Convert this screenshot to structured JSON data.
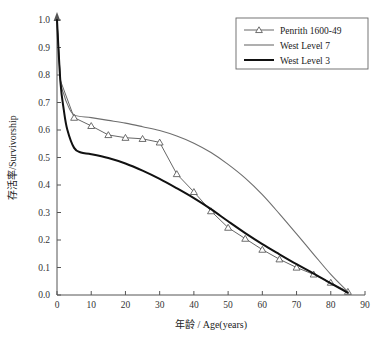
{
  "chart_data": {
    "type": "line",
    "title": "",
    "xlabel": "年龄 / Age(years)",
    "ylabel": "存活率/Survivorship",
    "xlim": [
      0,
      90
    ],
    "ylim": [
      0.0,
      1.0
    ],
    "xticks": [
      0,
      10,
      20,
      30,
      40,
      50,
      60,
      70,
      80,
      90
    ],
    "yticks": [
      0.0,
      0.1,
      0.2,
      0.3,
      0.4,
      0.5,
      0.6,
      0.7,
      0.8,
      0.9,
      1.0
    ],
    "grid": false,
    "legend_position": "top-right",
    "series": [
      {
        "name": "Penrith 1600-49",
        "color": "#555555",
        "marker": "triangle-open",
        "linewidth": 0.9,
        "x": [
          0,
          1,
          5,
          10,
          15,
          20,
          25,
          30,
          35,
          40,
          45,
          50,
          55,
          60,
          65,
          70,
          75,
          80,
          85
        ],
        "y": [
          1.0,
          0.78,
          0.645,
          0.615,
          0.582,
          0.572,
          0.568,
          0.555,
          0.44,
          0.375,
          0.305,
          0.245,
          0.205,
          0.165,
          0.13,
          0.1,
          0.075,
          0.045,
          0.012
        ]
      },
      {
        "name": "West Level 7",
        "color": "#6e6e6e",
        "marker": "none",
        "linewidth": 1.1,
        "x": [
          0,
          1,
          2,
          3,
          5,
          10,
          15,
          20,
          25,
          30,
          35,
          40,
          45,
          50,
          55,
          60,
          65,
          70,
          75,
          80,
          85
        ],
        "y": [
          1.0,
          0.785,
          0.73,
          0.695,
          0.655,
          0.645,
          0.635,
          0.625,
          0.612,
          0.598,
          0.578,
          0.552,
          0.518,
          0.475,
          0.425,
          0.365,
          0.295,
          0.222,
          0.148,
          0.075,
          0.012
        ]
      },
      {
        "name": "West Level 3",
        "color": "#111111",
        "marker": "none",
        "linewidth": 2.0,
        "x": [
          0,
          1,
          2,
          3,
          5,
          7,
          10,
          15,
          20,
          25,
          30,
          35,
          40,
          45,
          50,
          55,
          60,
          65,
          70,
          75,
          80,
          85
        ],
        "y": [
          1.0,
          0.775,
          0.672,
          0.602,
          0.535,
          0.518,
          0.512,
          0.498,
          0.478,
          0.452,
          0.422,
          0.388,
          0.352,
          0.312,
          0.268,
          0.225,
          0.185,
          0.148,
          0.112,
          0.078,
          0.042,
          0.008
        ]
      }
    ]
  },
  "legend": {
    "entries": [
      {
        "label": "Penrith 1600-49"
      },
      {
        "label": "West Level 7"
      },
      {
        "label": "West Level 3"
      }
    ]
  }
}
